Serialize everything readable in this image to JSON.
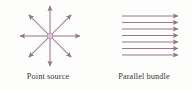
{
  "figure": {
    "width": 192,
    "height": 90,
    "background_color": "#fdfdfc",
    "ray_color": "#96798f",
    "caption_color": "#3a3438"
  },
  "panels": [
    {
      "id": "point-source",
      "caption": "Point source",
      "diagram_type": "radiating-rays",
      "ray_count": 8,
      "center": {
        "x": 50,
        "y": 36
      },
      "ray_length": 30,
      "ray_angles_deg": [
        0,
        45,
        90,
        135,
        180,
        225,
        270,
        315
      ],
      "source_dot": {
        "radius": 3,
        "color": "#c7a9c0"
      }
    },
    {
      "id": "parallel-bundle",
      "caption": "Parallel bundle",
      "diagram_type": "parallel-rays",
      "ray_count": 7,
      "ray_direction": "right",
      "x_start": 26,
      "x_end": 82,
      "y_first": 16,
      "y_spacing": 6.5
    }
  ]
}
